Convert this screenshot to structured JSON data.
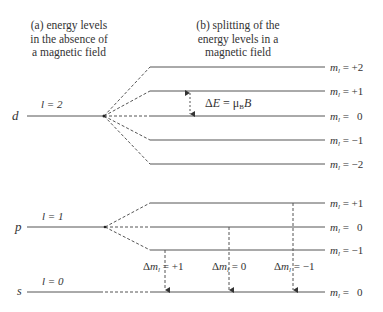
{
  "headers": {
    "a": [
      "(a) energy levels",
      "in the absence of",
      "a magnetic field"
    ],
    "b": [
      "(b) splitting of the",
      "energy levels in a",
      "magnetic field"
    ]
  },
  "orbitals": {
    "d": {
      "symbol": "d",
      "l_label": "l = 2",
      "ml": [
        "m_l = +2",
        "m_l = +1",
        "m_l = 0",
        "m_l = −1",
        "m_l = −2"
      ]
    },
    "p": {
      "symbol": "p",
      "l_label": "l = 1",
      "ml": [
        "m_l = +1",
        "m_l = 0",
        "m_l = −1"
      ]
    },
    "s": {
      "symbol": "s",
      "l_label": "l = 0",
      "ml": [
        "m_l = 0"
      ]
    }
  },
  "splitting_label": "ΔE = μB B",
  "transitions": [
    "Δm_l = +1",
    "Δm_l = 0",
    "Δm_l = −1"
  ],
  "colors": {
    "line": "#555555",
    "text": "#333333"
  }
}
